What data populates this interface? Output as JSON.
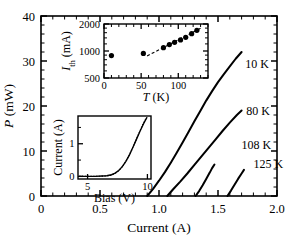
{
  "figure": {
    "background_color": "#ffffff",
    "line_color": "#000000"
  },
  "main_axes": {
    "xlabel": "Current (A)",
    "ylabel_italic": "P",
    "ylabel_unit": "(mW)",
    "x_ticks": [
      "0",
      "0.5",
      "1.0",
      "1.5",
      "2.0"
    ],
    "y_ticks": [
      "0",
      "10",
      "20",
      "30",
      "40"
    ]
  },
  "curve_labels": [
    {
      "text": "10 K",
      "x": 1.73,
      "y": 28.5
    },
    {
      "text": "80 K",
      "x": 1.74,
      "y": 18.0
    },
    {
      "text": "108 K",
      "x": 1.7,
      "y": 10.5
    },
    {
      "text": "125 K",
      "x": 1.8,
      "y": 6.2
    }
  ],
  "upper_inset": {
    "xlabel_italic": "T",
    "xlabel_unit": "(K)",
    "ylabel_italic": "I",
    "ylabel_sub": "th",
    "ylabel_unit": "(mA)",
    "x_ticks": [
      "0",
      "50",
      "100"
    ],
    "y_ticks": [
      "500",
      "1000",
      "2000"
    ]
  },
  "lower_inset": {
    "xlabel": "Bias (V)",
    "ylabel": "Current (A)",
    "x_ticks": [
      "5",
      "10"
    ],
    "y_ticks": [
      "0",
      "1"
    ]
  },
  "chart_data": {
    "type": "line",
    "title": "",
    "xlabel": "Current (A)",
    "ylabel": "P (mW)",
    "xlim": [
      0,
      2.0
    ],
    "ylim": [
      0,
      40
    ],
    "grid": false,
    "legend": "inline-curve-labels",
    "series": [
      {
        "name": "10 K",
        "threshold_current_A": 0.9,
        "points": [
          [
            0.9,
            0.0
          ],
          [
            0.95,
            1.6
          ],
          [
            1.0,
            3.4
          ],
          [
            1.05,
            5.3
          ],
          [
            1.1,
            7.4
          ],
          [
            1.15,
            9.6
          ],
          [
            1.2,
            11.9
          ],
          [
            1.25,
            14.2
          ],
          [
            1.3,
            16.6
          ],
          [
            1.35,
            18.9
          ],
          [
            1.4,
            21.2
          ],
          [
            1.45,
            23.3
          ],
          [
            1.5,
            25.3
          ],
          [
            1.55,
            27.1
          ],
          [
            1.6,
            28.8
          ],
          [
            1.65,
            30.5
          ],
          [
            1.7,
            32.0
          ]
        ]
      },
      {
        "name": "80 K",
        "threshold_current_A": 1.07,
        "points": [
          [
            1.07,
            0.0
          ],
          [
            1.12,
            1.5
          ],
          [
            1.18,
            3.2
          ],
          [
            1.24,
            5.0
          ],
          [
            1.3,
            6.9
          ],
          [
            1.36,
            8.8
          ],
          [
            1.42,
            10.7
          ],
          [
            1.48,
            12.6
          ],
          [
            1.54,
            14.5
          ],
          [
            1.6,
            16.3
          ],
          [
            1.66,
            18.0
          ],
          [
            1.7,
            19.0
          ]
        ]
      },
      {
        "name": "108 K",
        "threshold_current_A": 1.31,
        "points": [
          [
            1.31,
            0.0
          ],
          [
            1.34,
            1.1
          ],
          [
            1.37,
            2.4
          ],
          [
            1.4,
            3.8
          ],
          [
            1.43,
            5.2
          ],
          [
            1.45,
            6.2
          ],
          [
            1.47,
            7.0
          ]
        ]
      },
      {
        "name": "125 K",
        "threshold_current_A": 1.58,
        "points": [
          [
            1.58,
            0.0
          ],
          [
            1.61,
            1.2
          ],
          [
            1.64,
            2.5
          ],
          [
            1.67,
            3.8
          ],
          [
            1.7,
            5.0
          ],
          [
            1.72,
            5.8
          ]
        ]
      }
    ],
    "insets": [
      {
        "id": "upper_inset",
        "type": "scatter",
        "xlabel": "T (K)",
        "ylabel": "I_th (mA)",
        "xlim": [
          0,
          140
        ],
        "ylim": [
          500,
          2000
        ],
        "yscale": "log",
        "x_ticks": [
          0,
          50,
          100
        ],
        "y_ticks": [
          500,
          1000,
          2000
        ],
        "points": [
          [
            10,
            890
          ],
          [
            53,
            940
          ],
          [
            80,
            1090
          ],
          [
            88,
            1180
          ],
          [
            95,
            1250
          ],
          [
            103,
            1330
          ],
          [
            110,
            1420
          ],
          [
            118,
            1560
          ],
          [
            125,
            1700
          ]
        ],
        "fit_line": {
          "style": "dashed",
          "x": [
            58,
            132
          ],
          "y": [
            880,
            1830
          ]
        }
      },
      {
        "id": "lower_inset",
        "type": "line",
        "xlabel": "Bias (V)",
        "ylabel": "Current (A)",
        "xlim": [
          4.2,
          10.3
        ],
        "ylim": [
          -0.08,
          1.85
        ],
        "x_ticks": [
          5,
          10
        ],
        "y_ticks": [
          0,
          1
        ],
        "series": [
          {
            "name": "IV-solid",
            "points": [
              [
                4.3,
                0.0
              ],
              [
                5.0,
                0.0
              ],
              [
                5.6,
                0.0
              ],
              [
                6.2,
                0.01
              ],
              [
                6.6,
                0.02
              ],
              [
                7.0,
                0.05
              ],
              [
                7.3,
                0.1
              ],
              [
                7.6,
                0.18
              ],
              [
                7.9,
                0.3
              ],
              [
                8.2,
                0.46
              ],
              [
                8.5,
                0.66
              ],
              [
                8.8,
                0.9
              ],
              [
                9.1,
                1.15
              ],
              [
                9.4,
                1.4
              ],
              [
                9.7,
                1.63
              ],
              [
                9.95,
                1.8
              ]
            ]
          },
          {
            "name": "IV-dotted",
            "points": [
              [
                4.3,
                0.0
              ],
              [
                5.5,
                0.0
              ],
              [
                6.4,
                0.01
              ],
              [
                6.9,
                0.03
              ],
              [
                7.2,
                0.07
              ],
              [
                7.5,
                0.14
              ],
              [
                7.8,
                0.25
              ],
              [
                8.1,
                0.4
              ],
              [
                8.4,
                0.59
              ],
              [
                8.7,
                0.82
              ],
              [
                9.0,
                1.07
              ],
              [
                9.3,
                1.33
              ],
              [
                9.6,
                1.58
              ],
              [
                9.9,
                1.78
              ]
            ]
          }
        ]
      }
    ]
  }
}
